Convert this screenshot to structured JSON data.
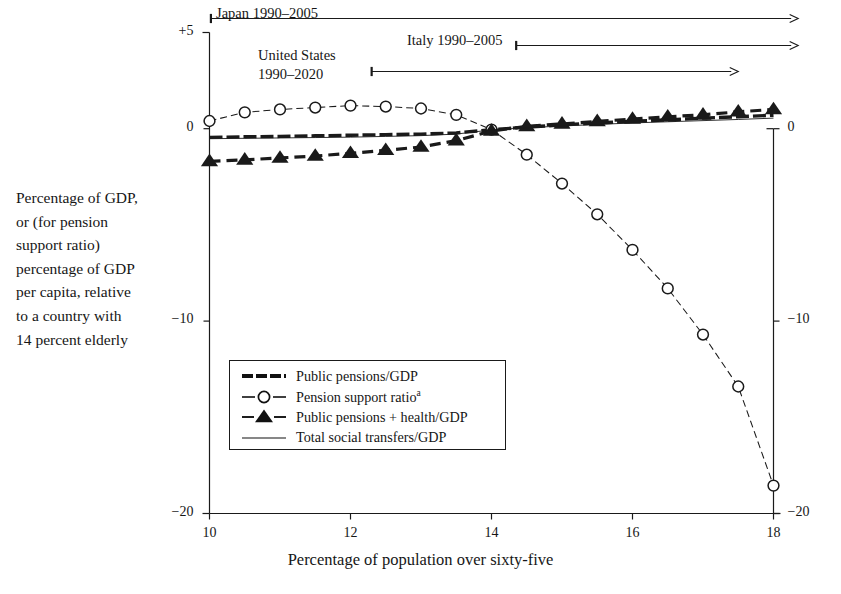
{
  "figure": {
    "y_axis_caption": "Percentage of GDP,\nor (for pension\nsupport ratio)\npercentage of GDP\nper capita, relative\nto a country with\n14 percent elderly",
    "x_axis_title": "Percentage of population over sixty-five"
  },
  "annotations": [
    {
      "name": "japan",
      "label": "Japan 1990–2005",
      "x_start": 10.02,
      "x_end": 18.35,
      "row": 0
    },
    {
      "name": "italy",
      "label": "Italy 1990–2005",
      "x_start": 14.35,
      "x_end": 18.35,
      "row": 1
    },
    {
      "name": "united-states",
      "label": "United States\n1990–2020",
      "x_start": 12.3,
      "x_end": 17.5,
      "row": 2
    }
  ],
  "legend": {
    "items": [
      {
        "label": "Public pensions/GDP",
        "marker": "thick-line",
        "color": "#111111"
      },
      {
        "label": "Pension support ratio",
        "marker": "dashed-circle",
        "color": "#111111",
        "superscript": "a"
      },
      {
        "label": "Public pensions + health/GDP",
        "marker": "dashed-triangle",
        "color": "#111111"
      },
      {
        "label": "Total social transfers/GDP",
        "marker": "thin-line",
        "color": "#111111"
      }
    ]
  },
  "chart_data": {
    "type": "line",
    "title": "",
    "xlabel": "Percentage of population over sixty-five",
    "ylabel": "Percentage of GDP, or (for pension support ratio) percentage of GDP per capita, relative to a country with 14 percent elderly",
    "xlim": [
      10,
      18
    ],
    "ylim": [
      -20,
      5
    ],
    "xticks": [
      10,
      12,
      14,
      16,
      18
    ],
    "xticklabels": [
      "10",
      "12",
      "14",
      "16",
      "18"
    ],
    "yticks": [
      5,
      0,
      -10,
      -20
    ],
    "yticklabels_left": [
      "+5",
      "0",
      "−10",
      "−20"
    ],
    "yticklabels_right": [
      "0",
      "−10",
      "−20"
    ],
    "grid": false,
    "legend_position": "inside-lower-left",
    "x": [
      10,
      10.5,
      11,
      11.5,
      12,
      12.5,
      13,
      13.5,
      14,
      14.5,
      15,
      15.5,
      16,
      16.5,
      17,
      17.5,
      18
    ],
    "series": [
      {
        "name": "Public pensions/GDP",
        "marker": "none",
        "style": "thick-solid",
        "values": [
          -0.45,
          -0.42,
          -0.4,
          -0.37,
          -0.34,
          -0.31,
          -0.28,
          -0.22,
          -0.05,
          0.08,
          0.2,
          0.3,
          0.38,
          0.46,
          0.55,
          0.62,
          0.7
        ]
      },
      {
        "name": "Pension support ratio",
        "marker": "open-circle",
        "style": "dashed",
        "values": [
          0.4,
          0.85,
          1.0,
          1.1,
          1.2,
          1.15,
          1.05,
          0.72,
          -0.05,
          -1.35,
          -2.85,
          -4.45,
          -6.3,
          -8.3,
          -10.7,
          -13.4,
          -18.55
        ]
      },
      {
        "name": "Public pensions + health/GDP",
        "marker": "filled-triangle",
        "style": "dashed",
        "values": [
          -1.7,
          -1.62,
          -1.52,
          -1.42,
          -1.28,
          -1.12,
          -0.95,
          -0.62,
          -0.12,
          0.12,
          0.25,
          0.38,
          0.5,
          0.62,
          0.72,
          0.88,
          1.0
        ]
      },
      {
        "name": "Total social transfers/GDP",
        "marker": "none",
        "style": "thin-solid",
        "values": [
          -0.52,
          -0.5,
          -0.48,
          -0.46,
          -0.44,
          -0.4,
          -0.36,
          -0.28,
          -0.06,
          0.05,
          0.14,
          0.22,
          0.3,
          0.36,
          0.42,
          0.48,
          0.55
        ]
      }
    ]
  }
}
